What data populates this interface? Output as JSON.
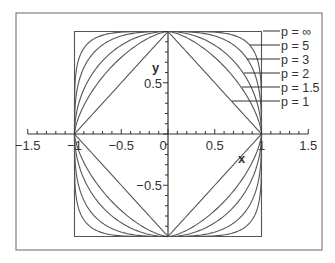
{
  "chart_data": {
    "type": "line",
    "title": "",
    "xlabel": "x",
    "ylabel": "y",
    "xlim": [
      -1.5,
      1.5
    ],
    "ylim": [
      -1,
      1
    ],
    "x_ticks": [
      "-1.5",
      "-1",
      "-0.5",
      "0",
      "0.5",
      "1",
      "1.5"
    ],
    "y_ticks": [
      "-0.5",
      "0.5"
    ],
    "grid": false,
    "legend_position": "right (leader lines)",
    "series": [
      {
        "name": "p = ∞",
        "p": "inf"
      },
      {
        "name": "p = 5",
        "p": 5
      },
      {
        "name": "p = 3",
        "p": 3
      },
      {
        "name": "p = 2",
        "p": 2
      },
      {
        "name": "p = 1.5",
        "p": 1.5
      },
      {
        "name": "p = 1",
        "p": 1
      }
    ],
    "colors": {
      "line": "#555555",
      "text": "#333333",
      "frame": "#666666"
    }
  }
}
